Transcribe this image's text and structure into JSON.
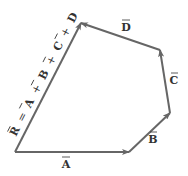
{
  "diagram": {
    "type": "vector-polygon-addition",
    "line_color": "#666666",
    "label_color": "#333333",
    "background": "#ffffff",
    "vectors": [
      {
        "name": "A",
        "label": "A",
        "from": [
          15,
          152
        ],
        "to": [
          129,
          152
        ]
      },
      {
        "name": "B",
        "label": "B",
        "from": [
          129,
          152
        ],
        "to": [
          170,
          113
        ]
      },
      {
        "name": "C",
        "label": "C",
        "from": [
          170,
          113
        ],
        "to": [
          160,
          50
        ]
      },
      {
        "name": "D",
        "label": "D",
        "from": [
          160,
          50
        ],
        "to": [
          81,
          23
        ]
      },
      {
        "name": "R",
        "label": "R = A + B + C + D",
        "from": [
          15,
          152
        ],
        "to": [
          81,
          23
        ]
      }
    ],
    "labels": {
      "A": "A",
      "B": "B",
      "C": "C",
      "D": "D",
      "R": "R",
      "equals": "=",
      "plus": "+",
      "R_equation": "R = A + B + C + D"
    }
  }
}
